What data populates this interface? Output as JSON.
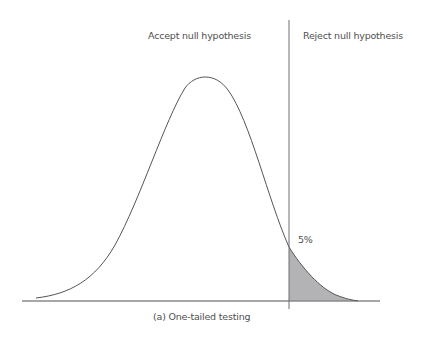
{
  "diagram": {
    "regions": {
      "accept_label": "Accept null hypothesis",
      "reject_label": "Reject null hypothesis"
    },
    "tail": {
      "percent_label": "5%",
      "fill_color": "#b3b3b6"
    },
    "caption": "(a) One-tailed testing",
    "colors": {
      "curve": "#555555",
      "axis": "#8a8a8a",
      "divider": "#6e6e6e",
      "text": "#4f4f4f"
    }
  }
}
